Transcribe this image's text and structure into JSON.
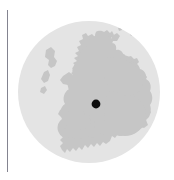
{
  "figure": {
    "type": "locator-map",
    "caption": "",
    "width_px": 174,
    "height_px": 180,
    "background_color": "#ffffff"
  },
  "axis_rule": {
    "name": "vertical-divider",
    "color": "#7d7d8a",
    "x_px": 7,
    "y_top_px": 10,
    "y_bottom_px": 172,
    "thickness_px": 1
  },
  "map": {
    "region_label": "Scotland",
    "projection_disc": {
      "shape": "circle",
      "center_x_px": 89,
      "center_y_px": 92,
      "radius_px": 71,
      "fill_color": "#e4e4e4"
    },
    "land": {
      "label": "Scotland mainland and islands",
      "fill_color": "#c6c6c6",
      "stroke_color": "none"
    },
    "marker": {
      "label": "location marker",
      "shape": "circle",
      "fill_color": "#0d0d0d",
      "center_x_px": 96,
      "center_y_px": 104,
      "radius_px": 4.4
    }
  },
  "chart_data": {
    "type": "map",
    "subtitle": "",
    "xlabel": "",
    "ylabel": "",
    "legend": [],
    "annotations": [],
    "series": [
      {
        "name": "marker",
        "values": [
          {
            "label": "",
            "x_px": 96,
            "y_px": 104
          }
        ]
      }
    ],
    "layers": [
      {
        "name": "ocean-disc",
        "color": "#e4e4e4"
      },
      {
        "name": "land",
        "color": "#c6c6c6"
      },
      {
        "name": "marker-point",
        "color": "#0d0d0d"
      }
    ],
    "grid": false
  }
}
